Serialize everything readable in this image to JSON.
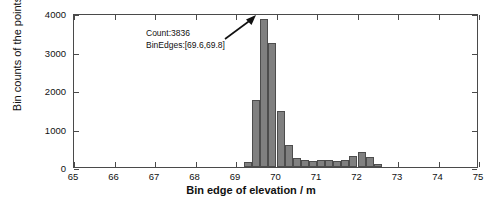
{
  "chart_data": {
    "type": "bar",
    "title": "",
    "xlabel": "Bin edge of elevation / m",
    "ylabel": "Bin counts of the points",
    "xlim": [
      65,
      75
    ],
    "ylim": [
      0,
      4000
    ],
    "xticks": [
      65,
      66,
      67,
      68,
      69,
      70,
      71,
      72,
      73,
      74,
      75
    ],
    "yticks": [
      0,
      1000,
      2000,
      3000,
      4000
    ],
    "grid": false,
    "legend": null,
    "bin_width": 0.2,
    "bar_color": "#808080",
    "bar_edge_color": "#4d4d4d",
    "bin_left_edges": [
      69.2,
      69.4,
      69.6,
      69.8,
      70.0,
      70.2,
      70.4,
      70.6,
      70.8,
      71.0,
      71.2,
      71.4,
      71.6,
      71.8,
      72.0,
      72.2,
      72.4
    ],
    "values": [
      120,
      1740,
      3836,
      3220,
      1450,
      570,
      240,
      175,
      150,
      170,
      185,
      145,
      180,
      290,
      400,
      255,
      70
    ],
    "annotations": [
      {
        "name": "peak-callout",
        "line1": "Count:3836",
        "line2": "BinEdges:[69.6,69.8]",
        "points_to_bin": [
          69.6,
          69.8
        ],
        "peak_value": 3836
      }
    ]
  },
  "axes": {
    "x_title": "Bin edge of elevation / m",
    "y_title": "Bin counts of the points",
    "x_tick_labels": [
      "65",
      "66",
      "67",
      "68",
      "69",
      "70",
      "71",
      "72",
      "73",
      "74",
      "75"
    ],
    "y_tick_labels": [
      "0",
      "1000",
      "2000",
      "3000",
      "4000"
    ]
  },
  "annotation": {
    "count_text": "Count:3836",
    "binedges_text": "BinEdges:[69.6,69.8]"
  }
}
